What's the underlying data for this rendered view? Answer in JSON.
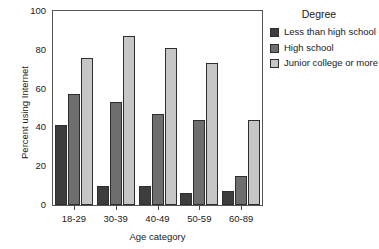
{
  "chart_data": {
    "type": "bar",
    "title": "",
    "xlabel": "Age category",
    "ylabel": "Percent using Internet",
    "categories": [
      "18-29",
      "30-39",
      "40-49",
      "50-59",
      "60-89"
    ],
    "ylim": [
      0,
      100
    ],
    "yticks": [
      0,
      20,
      40,
      60,
      80,
      100
    ],
    "grid": false,
    "legend_position": "right",
    "legend_title": "Degree",
    "series": [
      {
        "name": "Less than high school",
        "color": "#3d3d3d",
        "values": [
          41,
          10,
          10,
          6,
          7
        ]
      },
      {
        "name": "High school",
        "color": "#6e6e6e",
        "values": [
          57,
          53,
          47,
          44,
          15
        ]
      },
      {
        "name": "Junior college or more",
        "color": "#c6c6c6",
        "values": [
          76,
          87,
          81,
          73,
          44
        ]
      }
    ]
  }
}
